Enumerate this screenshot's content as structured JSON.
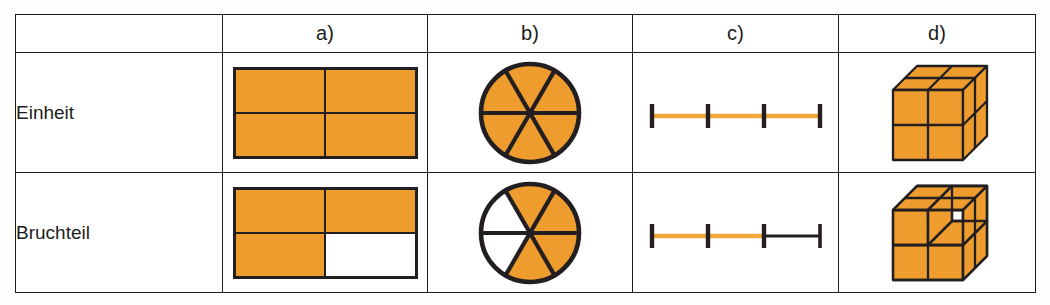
{
  "figure": {
    "kind": "fraction-representations-table",
    "colors": {
      "fill_orange": "#ee9c2e",
      "outline_black": "#231f20",
      "background_white": "#ffffff",
      "paper": "#fdfdfb"
    }
  },
  "table": {
    "column_headers": [
      "",
      "a)",
      "b)",
      "c)",
      "d)"
    ],
    "row_labels": [
      "Einheit",
      "Bruchteil"
    ],
    "cells": {
      "einheit": {
        "a": {
          "model": "rectangle-grid",
          "rows": 2,
          "cols": 2,
          "total_parts": 4,
          "filled_parts": 4,
          "filled_cells": [
            true,
            true,
            true,
            true
          ]
        },
        "b": {
          "model": "circle-sectors",
          "total_parts": 6,
          "filled_parts": 6,
          "filled_sectors": [
            true,
            true,
            true,
            true,
            true,
            true
          ]
        },
        "c": {
          "model": "number-line",
          "total_intervals": 3,
          "tick_count": 4,
          "filled_intervals": 3,
          "filled_color": "#f2a73b",
          "empty_color": "#231f20"
        },
        "d": {
          "model": "cube-2x2x2",
          "total_parts": 8,
          "filled_parts": 8,
          "removed_parts": 0
        }
      },
      "bruchteil": {
        "a": {
          "model": "rectangle-grid",
          "rows": 2,
          "cols": 2,
          "total_parts": 4,
          "filled_parts": 3,
          "filled_cells": [
            true,
            true,
            true,
            false
          ]
        },
        "b": {
          "model": "circle-sectors",
          "total_parts": 6,
          "filled_parts": 4,
          "filled_sectors": [
            true,
            true,
            true,
            true,
            false,
            false
          ]
        },
        "c": {
          "model": "number-line",
          "total_intervals": 3,
          "tick_count": 4,
          "filled_intervals": 2,
          "filled_color": "#f2a73b",
          "empty_color": "#231f20"
        },
        "d": {
          "model": "cube-2x2x2",
          "total_parts": 8,
          "filled_parts": 6,
          "removed_parts": 2
        }
      }
    }
  }
}
